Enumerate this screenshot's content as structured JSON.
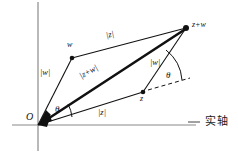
{
  "figure": {
    "type": "vector-parallelogram-diagram",
    "background_color": "#ffffff",
    "stroke_color": "#111111",
    "axis_color": "#8a8a8a",
    "axes": {
      "real_axis_label": "实轴",
      "origin_label": "O",
      "horizontal_axis_name": "real-axis",
      "vertical_axis_name": "imaginary-axis"
    },
    "vertices": [
      {
        "name": "origin",
        "label": "O",
        "x": 38,
        "y": 125
      },
      {
        "name": "w",
        "label": "w",
        "x": 72,
        "y": 58
      },
      {
        "name": "z",
        "label": "z",
        "x": 143,
        "y": 92
      },
      {
        "name": "z-plus-w",
        "label": "z+w",
        "x": 186,
        "y": 28
      }
    ],
    "edge_labels": [
      {
        "name": "magnitude-w-left",
        "text": "|w|",
        "x": 44,
        "y": 74
      },
      {
        "name": "magnitude-z-top",
        "text": "|z|",
        "x": 112,
        "y": 36
      },
      {
        "name": "magnitude-z-plus-w",
        "text": "|z+w|",
        "x": 88,
        "y": 75
      },
      {
        "name": "magnitude-w-right",
        "text": "|w|",
        "x": 155,
        "y": 64
      },
      {
        "name": "magnitude-z-bottom",
        "text": "|z|",
        "x": 104,
        "y": 113
      }
    ],
    "angles": [
      {
        "name": "theta-at-origin",
        "text": "θ",
        "x": 57,
        "y": 110
      },
      {
        "name": "theta-at-z",
        "text": "θ",
        "x": 168,
        "y": 76
      }
    ]
  }
}
